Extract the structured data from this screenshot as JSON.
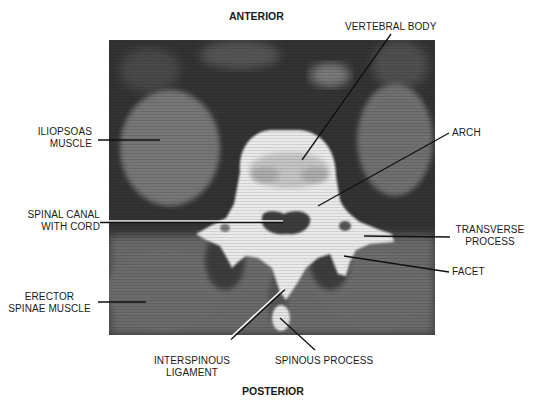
{
  "orientation": {
    "top": "ANTERIOR",
    "bottom": "POSTERIOR"
  },
  "labels": {
    "vertebral_body": "VERTEBRAL BODY",
    "iliopsoas_line1": "ILIOPSOAS",
    "iliopsoas_line2": "MUSCLE",
    "arch": "ARCH",
    "spinal_canal_line1": "SPINAL CANAL",
    "spinal_canal_line2": "WITH CORD",
    "transverse_line1": "TRANSVERSE",
    "transverse_line2": "PROCESS",
    "facet": "FACET",
    "erector_line1": "ERECTOR",
    "erector_line2": "SPINAE MUSCLE",
    "interspinous_line1": "INTERSPINOUS",
    "interspinous_line2": "LIGAMENT",
    "spinous_process": "SPINOUS PROCESS"
  },
  "colors": {
    "background": "#ffffff",
    "scan_dark": "#2e2e2e",
    "soft_tissue": "#6e6e6e",
    "bone": "#ececec",
    "text": "#1a1a1a"
  }
}
